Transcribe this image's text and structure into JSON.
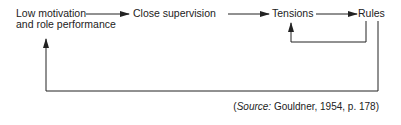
{
  "diagram": {
    "nodes": [
      {
        "id": "low-motivation",
        "line1": "Low motivation",
        "line2": "and role performance"
      },
      {
        "id": "close-supervision",
        "label": "Close supervision"
      },
      {
        "id": "tensions",
        "label": "Tensions"
      },
      {
        "id": "rules",
        "label": "Rules"
      }
    ],
    "edges": [
      {
        "from": "low-motivation",
        "to": "close-supervision"
      },
      {
        "from": "close-supervision",
        "to": "tensions"
      },
      {
        "from": "tensions",
        "to": "rules"
      },
      {
        "from": "rules",
        "to": "tensions",
        "type": "feedback"
      },
      {
        "from": "rules",
        "to": "low-motivation",
        "type": "feedback"
      }
    ],
    "source": {
      "open": "(",
      "label": "Source:",
      "text": " Gouldner, 1954, p. 178)"
    },
    "colors": {
      "line": "#222222",
      "text": "#222222",
      "background": "#ffffff"
    }
  }
}
